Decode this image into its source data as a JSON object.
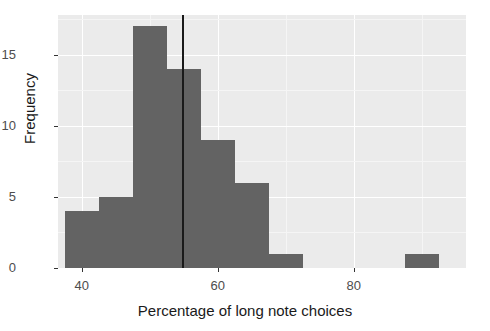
{
  "chart_data": {
    "type": "bar",
    "title": "",
    "subtitle": "",
    "xlabel": "Percentage of long note choices",
    "ylabel": "Frequency",
    "xlim": [
      36.5,
      96.5
    ],
    "ylim": [
      0,
      17.8
    ],
    "grid": true,
    "legend": null,
    "bin_width": 5,
    "categories": [
      "37.5-42.5",
      "42.5-47.5",
      "47.5-52.5",
      "52.5-57.5",
      "57.5-62.5",
      "62.5-67.5",
      "67.5-72.5",
      "87.5-92.5"
    ],
    "bins": [
      {
        "left": 37.5,
        "right": 42.5,
        "value": 4
      },
      {
        "left": 42.5,
        "right": 47.5,
        "value": 5
      },
      {
        "left": 47.5,
        "right": 52.5,
        "value": 17
      },
      {
        "left": 52.5,
        "right": 57.5,
        "value": 14
      },
      {
        "left": 57.5,
        "right": 62.5,
        "value": 9
      },
      {
        "left": 62.5,
        "right": 67.5,
        "value": 6
      },
      {
        "left": 67.5,
        "right": 72.5,
        "value": 1
      },
      {
        "left": 87.5,
        "right": 92.5,
        "value": 1
      }
    ],
    "values": [
      4,
      5,
      17,
      14,
      9,
      6,
      1,
      1
    ],
    "x_ticks": [
      40,
      60,
      80
    ],
    "x_tick_labels": [
      "40",
      "60",
      "80"
    ],
    "y_ticks": [
      0,
      5,
      10,
      15
    ],
    "y_tick_labels": [
      "0",
      "5",
      "10",
      "15"
    ],
    "annotations": [
      {
        "name": "mean-reference-line",
        "type": "vline",
        "x": 54.9,
        "color": "#1a1a1a"
      }
    ],
    "colors": {
      "bar_fill": "#636363",
      "panel_background": "#ebebeb",
      "gridline_major": "#ffffff",
      "gridline_minor": "#f5f5f5",
      "axis_text": "#4d4d4d",
      "axis_title": "#1a1a1a",
      "reference_line": "#1a1a1a"
    }
  }
}
